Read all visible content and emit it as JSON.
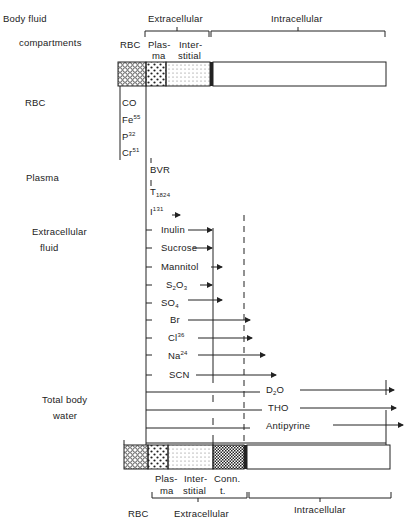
{
  "header": {
    "title_line1": "Body fluid",
    "title_line2": "compartments",
    "top_brackets": {
      "extracellular": "Extracellular",
      "intracellular": "Intracellular"
    },
    "top_bar_labels": {
      "rbc": "RBC",
      "plasma_1": "Plas-",
      "plasma_2": "ma",
      "interstitial_1": "Inter-",
      "interstitial_2": "stitial"
    }
  },
  "rows": [
    {
      "label": "RBC",
      "markers": [
        {
          "name": "CO"
        },
        {
          "name": "Fe",
          "sup": "55",
          "sub": "59"
        },
        {
          "name": "P",
          "sup": "32"
        },
        {
          "name": "Cr",
          "sup": "51"
        }
      ]
    },
    {
      "label": "Plasma",
      "markers": [
        {
          "name": "BVR"
        },
        {
          "name": "T",
          "sub": "1824"
        },
        {
          "name": "I",
          "sup": "131"
        }
      ]
    },
    {
      "label_line1": "Extracellular",
      "label_line2": "fluid",
      "markers": [
        {
          "name": "Inulin"
        },
        {
          "name": "Sucrose"
        },
        {
          "name": "Mannitol"
        },
        {
          "name": "S",
          "sub": "2",
          "name2": "O",
          "sub2": "3"
        },
        {
          "name": "SO",
          "sub": "4"
        },
        {
          "name": "Br"
        },
        {
          "name": "Cl",
          "sup": "36",
          "sub": "38"
        },
        {
          "name": "Na",
          "sup": "24"
        },
        {
          "name": "SCN"
        }
      ]
    },
    {
      "label_line1": "Total body",
      "label_line2": "water",
      "markers": [
        {
          "name": "D",
          "sub": "2",
          "name2": "O"
        },
        {
          "name": "THO"
        },
        {
          "name": "Antipyrine"
        }
      ]
    }
  ],
  "footer": {
    "bar_labels": {
      "plasma_1": "Plas-",
      "plasma_2": "ma",
      "interstitial_1": "Inter-",
      "interstitial_2": "stitial",
      "conn_1": "Conn.",
      "conn_2": "t."
    },
    "bottom_labels": {
      "rbc": "RBC",
      "extracellular": "Extracellular",
      "intracellular": "Intracellular"
    }
  }
}
